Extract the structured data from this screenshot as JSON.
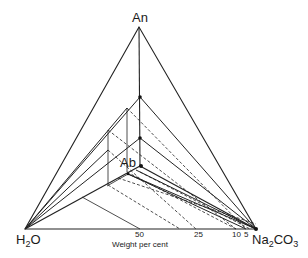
{
  "diagram": {
    "type": "ternary-phase-diagram",
    "vertices": {
      "top": "An",
      "left_main": "H",
      "left_sub": "2",
      "left_tail": "O",
      "right_main": "Na",
      "right_sub1": "2",
      "right_mid": "CO",
      "right_sub2": "3"
    },
    "interior_point_label": "Ab",
    "axis_title": "Weight per cent",
    "base_ticks": [
      "50",
      "25",
      "10",
      "5"
    ],
    "colors": {
      "line": "#222222",
      "background": "#ffffff"
    }
  }
}
